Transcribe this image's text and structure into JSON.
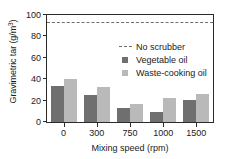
{
  "chart_data": {
    "type": "bar",
    "title": "",
    "xlabel": "Mixing speed (rpm)",
    "ylabel": "Gravimetric tar (g/m³)",
    "ylabel_base": "Gravimetric tar (g/m",
    "ylabel_sup": "3",
    "ylabel_tail": ")",
    "categories": [
      "0",
      "300",
      "750",
      "1000",
      "1500"
    ],
    "series": [
      {
        "name": "Vegetable oil",
        "color": "#6f6f6f",
        "values": [
          34,
          25,
          13,
          9,
          21
        ]
      },
      {
        "name": "Waste-cooking oil",
        "color": "#b9b9b9",
        "values": [
          40,
          33,
          17,
          22,
          26
        ]
      }
    ],
    "reference_line": {
      "name": "No scrubber",
      "value": 93,
      "style": "dashed",
      "color": "#6e6e6e"
    },
    "ylim": [
      0,
      100
    ],
    "yticks": [
      0,
      20,
      40,
      60,
      80,
      100
    ],
    "ytick_labels": [
      "0",
      "20",
      "40",
      "60",
      "80",
      "100"
    ],
    "grid": false,
    "legend_position": "upper-right-inside",
    "legend": [
      "No scrubber",
      "Vegetable oil",
      "Waste-cooking oil"
    ]
  }
}
